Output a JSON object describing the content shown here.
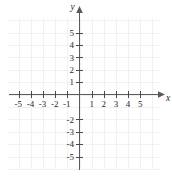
{
  "chart_data": {
    "type": "scatter",
    "title": "",
    "subtitle": "",
    "xlabel": "x",
    "ylabel": "y",
    "xlim": [
      -5.9,
      5.9
    ],
    "ylim": [
      -5.9,
      5.9
    ],
    "x_ticks": [
      -5,
      -4,
      -3,
      -2,
      -1,
      1,
      2,
      3,
      4,
      5
    ],
    "y_ticks": [
      5,
      4,
      3,
      2,
      1,
      -2,
      -3,
      -4,
      -5
    ],
    "x_tick_labels": [
      "-5",
      "-4",
      "-3",
      "-2",
      "-1",
      "1",
      "2",
      "3",
      "4",
      "5"
    ],
    "y_tick_labels": [
      "5",
      "4",
      "3",
      "2",
      "1",
      "-2",
      "-3",
      "-4",
      "-5"
    ],
    "grid": true,
    "grid_step": 1,
    "legend": "none",
    "series": [],
    "annotations": []
  },
  "axes": {
    "x_axis_name": "x",
    "y_axis_name": "y",
    "origin_label": ""
  },
  "colors": {
    "grid": "#f1f1f1",
    "axis": "#5b5b5b",
    "tick": "#4a4a4a",
    "label": "#2b2b2b",
    "background": "#ffffff"
  }
}
